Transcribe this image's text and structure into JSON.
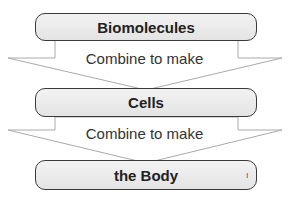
{
  "boxes": [
    {
      "label": "Biomolecules"
    },
    {
      "label": "Cells"
    },
    {
      "label": "the Body"
    }
  ],
  "arrows": [
    {
      "label": "Combine to make"
    },
    {
      "label": "Combine to make"
    }
  ],
  "colors": {
    "box_border": "#3a3a3a",
    "box_fill": "#ebebeb",
    "arrow_stroke": "#aaaaaa"
  }
}
